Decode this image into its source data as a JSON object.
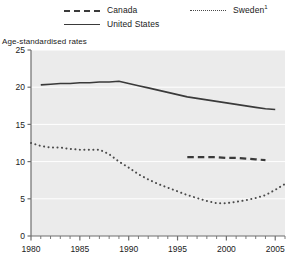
{
  "chart_data": {
    "type": "line",
    "title": "",
    "subtitle": "",
    "ylabel": "Age-standardised rates",
    "xlabel": "",
    "ylim": [
      0,
      25
    ],
    "xlim": [
      1980,
      2006
    ],
    "yticks": [
      0,
      5,
      10,
      15,
      20,
      25
    ],
    "xticks": [
      1980,
      1985,
      1990,
      1995,
      2000,
      2005
    ],
    "xtick_labels": [
      "1980",
      "1985",
      "1990",
      "1995",
      "2000",
      "2005"
    ],
    "ytick_labels": [
      "0",
      "5",
      "10",
      "15",
      "20",
      "25"
    ],
    "x_minor_tick_interval": 1,
    "grid": "horizontal",
    "grid_color": "#ffffff",
    "plot_background": "#ebebeb",
    "legend_position": "top",
    "series": [
      {
        "name": "Canada",
        "legend_label": "Canada",
        "style": "dashed",
        "color": "#3a3a3a",
        "x": [
          1996,
          1997,
          1998,
          1999,
          2000,
          2001,
          2002,
          2003,
          2004
        ],
        "values": [
          10.6,
          10.6,
          10.6,
          10.6,
          10.5,
          10.5,
          10.4,
          10.3,
          10.2
        ]
      },
      {
        "name": "United States",
        "legend_label": "United States",
        "style": "solid",
        "color": "#3a3a3a",
        "x": [
          1981,
          1982,
          1983,
          1984,
          1985,
          1986,
          1987,
          1988,
          1989,
          1990,
          1991,
          1992,
          1993,
          1994,
          1995,
          1996,
          1997,
          1998,
          1999,
          2000,
          2001,
          2002,
          2003,
          2004,
          2005
        ],
        "values": [
          20.3,
          20.4,
          20.5,
          20.5,
          20.6,
          20.6,
          20.7,
          20.7,
          20.8,
          20.5,
          20.2,
          19.9,
          19.6,
          19.3,
          19.0,
          18.7,
          18.5,
          18.3,
          18.1,
          17.9,
          17.7,
          17.5,
          17.3,
          17.1,
          17.0
        ]
      },
      {
        "name": "Sweden",
        "legend_label": "Sweden",
        "legend_superscript": "1",
        "style": "dotted",
        "color": "#4a4a4a",
        "x": [
          1980,
          1981,
          1982,
          1983,
          1984,
          1985,
          1986,
          1987,
          1988,
          1989,
          1990,
          1991,
          1992,
          1993,
          1994,
          1995,
          1996,
          1997,
          1998,
          1999,
          2000,
          2001,
          2002,
          2003,
          2004,
          2005,
          2006
        ],
        "values": [
          12.5,
          12.1,
          11.9,
          11.9,
          11.7,
          11.6,
          11.6,
          11.6,
          11.0,
          10.0,
          9.2,
          8.3,
          7.6,
          7.0,
          6.5,
          6.0,
          5.5,
          5.1,
          4.7,
          4.4,
          4.4,
          4.6,
          4.8,
          5.1,
          5.5,
          6.2,
          7.0
        ]
      }
    ]
  },
  "legend": {
    "canada": "Canada",
    "united_states": "United States",
    "sweden": "Sweden",
    "sweden_superscript": "1"
  },
  "axes": {
    "y_title": "Age-standardised rates"
  }
}
